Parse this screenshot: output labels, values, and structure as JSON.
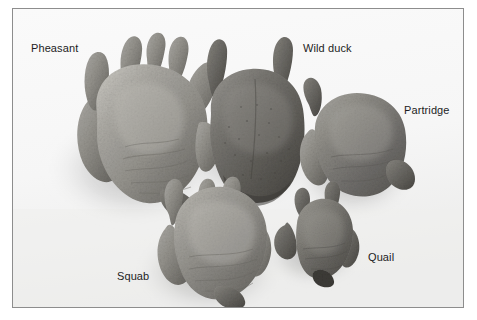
{
  "figure": {
    "kind": "photograph",
    "background_color": "#fdfdfd",
    "frame_color": "#8d8d8d",
    "label_color": "#1d1d1d"
  },
  "labels": {
    "pheasant": "Pheasant",
    "wild_duck": "Wild duck",
    "partridge": "Partridge",
    "squab": "Squab",
    "quail": "Quail"
  },
  "birds": [
    {
      "name": "pheasant",
      "label": "Pheasant",
      "tone": "#9a9893",
      "relative_size": "largest"
    },
    {
      "name": "wild-duck",
      "label": "Wild duck",
      "tone": "#6e6c68",
      "relative_size": "large"
    },
    {
      "name": "partridge",
      "label": "Partridge",
      "tone": "#7e7c77",
      "relative_size": "medium"
    },
    {
      "name": "squab",
      "label": "Squab",
      "tone": "#8b8984",
      "relative_size": "medium"
    },
    {
      "name": "quail",
      "label": "Quail",
      "tone": "#77756f",
      "relative_size": "smallest"
    }
  ]
}
